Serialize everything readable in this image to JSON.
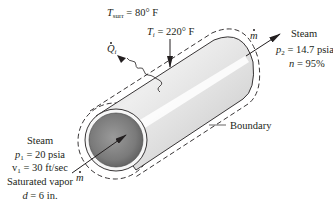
{
  "figure": {
    "surroundings": {
      "symbol": "T",
      "subscript": "surr",
      "value": "= 80° F"
    },
    "surface_temp": {
      "symbol": "T",
      "subscript": "i",
      "value": "= 220° F"
    },
    "heat_transfer": {
      "symbol": "Q",
      "subscript": "i"
    },
    "outlet": {
      "mass_flow_symbol": "m",
      "title": "Steam",
      "pressure_symbol": "p",
      "pressure_subscript": "2",
      "pressure_value": "= 14.7 psia",
      "efficiency_symbol": "n",
      "efficiency_value": "= 95%"
    },
    "boundary_label": "Boundary",
    "inlet": {
      "mass_flow_symbol": "m",
      "title": "Steam",
      "pressure_symbol": "p",
      "pressure_subscript": "1",
      "pressure_value": "= 20 psia",
      "velocity_symbol": "v",
      "velocity_subscript": "1",
      "velocity_value": "= 30 ft/sec",
      "state": "Saturated vapor",
      "diameter_symbol": "d",
      "diameter_value": "= 6 in."
    }
  },
  "colors": {
    "ink": "#231f20",
    "pipe_light": "#f2f2f2",
    "pipe_mid": "#d9d9d9",
    "pipe_shadow": "#bdbdbd",
    "bore_dark": "#6e6e6e",
    "bore_light": "#a8a8a8"
  }
}
